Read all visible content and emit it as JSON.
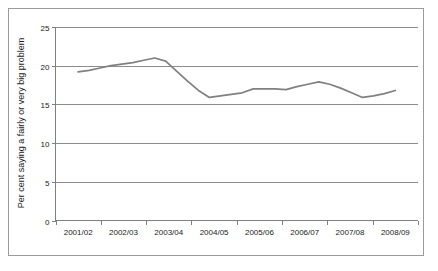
{
  "chart_data": {
    "type": "line",
    "title": "",
    "xlabel": "",
    "ylabel": "Per cent saying a fairly or very big problem",
    "ylim": [
      0,
      25
    ],
    "yticks": [
      0,
      5,
      10,
      15,
      20,
      25
    ],
    "ytick_labels": [
      "0",
      "5",
      "10",
      "15",
      "20",
      "25"
    ],
    "grid": true,
    "legend": "none",
    "categories": [
      "2001/02",
      "2002/03",
      "2003/04",
      "2004/05",
      "2005/06",
      "2006/07",
      "2007/08",
      "2008/09"
    ],
    "series": [
      {
        "name": "Per cent saying a fairly or very big problem",
        "color": "#808080",
        "values": [
          19.2,
          21.0,
          15.9,
          17.0,
          17.0,
          17.9,
          15.9,
          16.8
        ],
        "points": [
          {
            "x": "2001/02",
            "y": 19.2
          },
          {
            "x": "2001/02 Q2",
            "y": 19.4
          },
          {
            "x": "2001/02 Q3",
            "y": 19.7
          },
          {
            "x": "2001/02 Q4",
            "y": 20.0
          },
          {
            "x": "2002/03 Q1",
            "y": 20.2
          },
          {
            "x": "2002/03 Q2",
            "y": 20.4
          },
          {
            "x": "2002/03 Q3",
            "y": 20.7
          },
          {
            "x": "2002/03",
            "y": 21.0
          },
          {
            "x": "2002/03 Q5",
            "y": 20.6
          },
          {
            "x": "2003/04 Q1",
            "y": 19.3
          },
          {
            "x": "2003/04 Q2",
            "y": 18.0
          },
          {
            "x": "2003/04 Q3",
            "y": 16.8
          },
          {
            "x": "2003/04",
            "y": 15.9
          },
          {
            "x": "2003/04 Q5",
            "y": 16.1
          },
          {
            "x": "2004/05 Q1",
            "y": 16.3
          },
          {
            "x": "2004/05 Q2",
            "y": 16.5
          },
          {
            "x": "2004/05",
            "y": 17.0
          },
          {
            "x": "2005/06 Q1",
            "y": 17.0
          },
          {
            "x": "2005/06",
            "y": 17.0
          },
          {
            "x": "2005/06 Q3",
            "y": 16.9
          },
          {
            "x": "2006/07 Q1",
            "y": 17.3
          },
          {
            "x": "2006/07 Q2",
            "y": 17.6
          },
          {
            "x": "2006/07",
            "y": 17.9
          },
          {
            "x": "2006/07 Q4",
            "y": 17.6
          },
          {
            "x": "2007/08 Q1",
            "y": 17.1
          },
          {
            "x": "2007/08 Q2",
            "y": 16.5
          },
          {
            "x": "2007/08",
            "y": 15.9
          },
          {
            "x": "2007/08 Q4",
            "y": 16.1
          },
          {
            "x": "2008/09 Q1",
            "y": 16.4
          },
          {
            "x": "2008/09",
            "y": 16.8
          }
        ]
      }
    ]
  },
  "axes": {
    "y_axis_title": "Per cent saying a fairly or very big problem"
  },
  "colors": {
    "line": "#808080",
    "gridline": "#8c8c8c",
    "axis": "#808080",
    "border": "#9a9a9a",
    "text": "#1a1a1a",
    "background": "#ffffff"
  }
}
